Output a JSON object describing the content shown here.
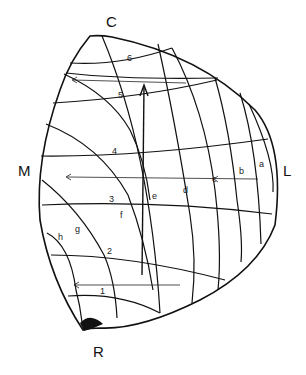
{
  "diagram": {
    "type": "curvilinear grid on spherical triangle",
    "corner_labels": {
      "top": "C",
      "left": "M",
      "right": "L",
      "bottom": "R"
    },
    "horizontal_curve_labels": [
      "1",
      "2",
      "3",
      "4",
      "5",
      "6"
    ],
    "oblique_curve_labels": [
      "a",
      "b",
      "c",
      "d",
      "e",
      "f",
      "g",
      "h"
    ],
    "arrows": [
      {
        "name": "vertical-arrow",
        "direction": "up"
      },
      {
        "name": "arrow-row-5",
        "direction": "left"
      },
      {
        "name": "arrow-row-bc",
        "direction": "left"
      },
      {
        "name": "arrow-row-1",
        "direction": "left"
      }
    ],
    "filled_region": "bottom corner near R",
    "colors": {
      "stroke": "#111111",
      "background": "#ffffff"
    }
  }
}
